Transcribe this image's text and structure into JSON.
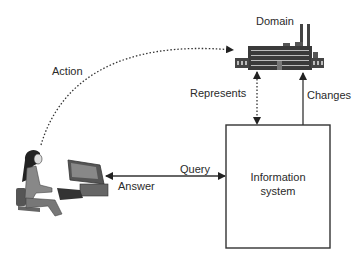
{
  "diagram": {
    "nodes": {
      "domain": {
        "label": "Domain",
        "icon": "factory-icon"
      },
      "user": {
        "icon": "person-at-computer-icon"
      },
      "information_system": {
        "line1": "Information",
        "line2": "system"
      }
    },
    "edges": {
      "action": {
        "label": "Action",
        "style": "dotted",
        "from": "user",
        "to": "domain"
      },
      "represents": {
        "label": "Represents",
        "style": "dotted",
        "direction": "bidirectional"
      },
      "changes": {
        "label": "Changes",
        "style": "solid",
        "from": "information_system",
        "to": "domain"
      },
      "query": {
        "label": "Query",
        "style": "solid",
        "from": "user",
        "to": "information_system"
      },
      "answer": {
        "label": "Answer",
        "style": "solid",
        "from": "information_system",
        "to": "user"
      }
    },
    "colors": {
      "line": "#333333",
      "text": "#2a2a2a",
      "background": "#ffffff"
    }
  }
}
